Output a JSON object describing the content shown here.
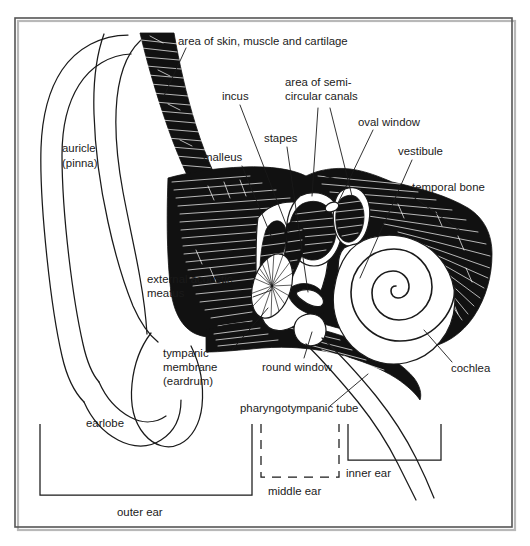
{
  "figure": {
    "type": "labelled anatomical diagram",
    "background_color": "#ffffff",
    "ink_color": "#1a1a1a",
    "frame_color": "#555555",
    "bone_fill_color": "#111111"
  },
  "labels": {
    "area_of_skin": "area of skin, muscle and cartilage",
    "incus": "incus",
    "semicircular_line1": "area of semi-",
    "semicircular_line2": "circular canals",
    "stapes": "stapes",
    "oval_window": "oval window",
    "vestibule": "vestibule",
    "malleus": "malleus",
    "temporal_bone": "temporal bone",
    "auricle_line1": "auricle",
    "auricle_line2": "(pinna)",
    "meatus_line1": "external acoustic",
    "meatus_line2": "meatus",
    "tympanic_line1": "tympanic",
    "tympanic_line2": "membrane",
    "tympanic_line3": "(eardrum)",
    "round_window": "round window",
    "cochlea": "cochlea",
    "pharyngotympanic_tube": "pharyngotympanic tube",
    "earlobe": "earlobe",
    "inner_ear": "inner ear",
    "middle_ear": "middle ear",
    "outer_ear": "outer ear"
  },
  "regions": [
    {
      "id": "outer-ear",
      "label": "outer ear",
      "bracket_style": "solid"
    },
    {
      "id": "middle-ear",
      "label": "middle ear",
      "bracket_style": "dashed"
    },
    {
      "id": "inner-ear",
      "label": "inner ear",
      "bracket_style": "solid"
    }
  ],
  "structures": [
    "auricle (pinna)",
    "earlobe",
    "external acoustic meatus",
    "tympanic membrane (eardrum)",
    "malleus",
    "incus",
    "stapes",
    "oval window",
    "round window",
    "vestibule",
    "area of semi-circular canals",
    "cochlea",
    "pharyngotympanic tube",
    "temporal bone",
    "area of skin, muscle and cartilage"
  ]
}
